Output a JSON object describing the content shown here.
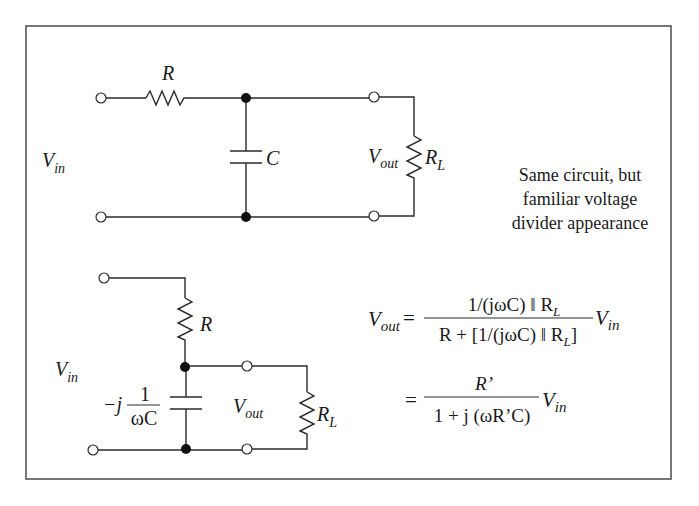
{
  "diagram": {
    "top_circuit": {
      "resistor_label": "R",
      "capacitor_label": "C",
      "input_label": {
        "main": "V",
        "sub": "in"
      },
      "output_label": {
        "main": "V",
        "sub": "out"
      },
      "load_label": {
        "main": "R",
        "sub": "L"
      }
    },
    "caption": {
      "lines": [
        "Same circuit, but",
        "familiar voltage",
        "divider appearance"
      ]
    },
    "bottom_circuit": {
      "resistor_label": "R",
      "impedance_prefix": "−j",
      "impedance_numerator": "1",
      "impedance_denominator": "ωC",
      "input_label": {
        "main": "V",
        "sub": "in"
      },
      "output_label": {
        "main": "V",
        "sub": "out"
      },
      "load_label": {
        "main": "R",
        "sub": "L"
      }
    },
    "equations": {
      "lhs": {
        "main": "V",
        "sub": "out"
      },
      "eq1": {
        "equals": "=",
        "numerator": "1/(jωC) ‖ R",
        "numerator_sub": "L",
        "denominator": "R + [1/(jωC) ‖ R",
        "denominator_sub": "L",
        "denominator_tail": "]",
        "multiplier": {
          "main": "V",
          "sub": "in"
        }
      },
      "eq2": {
        "equals": "=",
        "numerator": "R’",
        "denominator": "1 + j (ωR’C)",
        "multiplier": {
          "main": "V",
          "sub": "in"
        }
      }
    }
  }
}
